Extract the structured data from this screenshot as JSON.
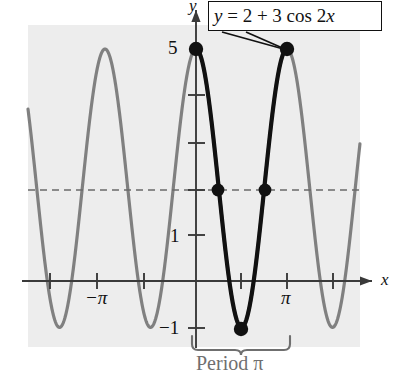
{
  "figure": {
    "name": "trigonometric-cosine-graph",
    "background_color": "#ededed",
    "page_background": "#ffffff",
    "curve_color_secondary": "#808080",
    "curve_color_highlight": "#111111",
    "axis_color": "#3a3a3a",
    "midline_color": "#6a6a6a",
    "annotation_color": "#6f6f6f"
  },
  "callout": {
    "equation_text": "y = 2 + 3 cos 2x",
    "parts": {
      "y": "y",
      "equals": " = 2 + 3 cos 2",
      "x": "x"
    }
  },
  "axes": {
    "y_axis_label": "y",
    "x_axis_label": "x",
    "y_tick_labels": [
      "5",
      "1",
      "−1"
    ],
    "x_tick_labels": [
      "−π",
      "π"
    ]
  },
  "annotations": {
    "period_label": "Period π",
    "period_symbol": "π"
  },
  "chart_data": {
    "type": "line",
    "title": "y = 2 + 3 cos 2x",
    "xlabel": "x",
    "ylabel": "y",
    "function": "y = 2 + 3*cos(2x)",
    "amplitude": 3,
    "vertical_shift": 2,
    "period": "π",
    "midline_y": 2,
    "maximum_y": 5,
    "minimum_y": -1,
    "xlim": [
      -3.55,
      3.55
    ],
    "ylim": [
      -1.6,
      5.6
    ],
    "grid": false,
    "legend": "none",
    "y_ticks": [
      5,
      4,
      3,
      2,
      1,
      0,
      -1
    ],
    "y_tick_labels_shown": [
      {
        "value": 5,
        "label": "5"
      },
      {
        "value": 1,
        "label": "1"
      },
      {
        "value": -1,
        "label": "−1"
      }
    ],
    "x_ticks_radians": [
      -3.1416,
      -2.3562,
      -1.5708,
      -0.7854,
      0,
      0.7854,
      1.5708,
      2.3562,
      3.1416
    ],
    "x_tick_labels_shown": [
      {
        "value": -3.1416,
        "label": "−π"
      },
      {
        "value": 3.1416,
        "label": "π"
      }
    ],
    "highlighted_interval": [
      0,
      3.1416
    ],
    "marked_points": [
      {
        "x": 0,
        "y": 5,
        "note": "maximum at x=0"
      },
      {
        "x": 0.7854,
        "y": 2,
        "note": "midline crossing at x=π/4"
      },
      {
        "x": 1.5708,
        "y": -1,
        "note": "minimum at x=π/2"
      },
      {
        "x": 2.3562,
        "y": 2,
        "note": "midline crossing at x=3π/4"
      },
      {
        "x": 3.1416,
        "y": 5,
        "note": "maximum at x=π"
      }
    ],
    "dashed_line": {
      "y": 2,
      "style": "dashed",
      "note": "midline y = 2"
    },
    "series": [
      {
        "name": "y = 2 + 3 cos 2x",
        "x": [
          -3.55,
          -3.4,
          -3.25,
          -3.1,
          -2.95,
          -2.8,
          -2.65,
          -2.5,
          -2.35,
          -2.2,
          -2.05,
          -1.9,
          -1.75,
          -1.6,
          -1.45,
          -1.3,
          -1.15,
          -1.0,
          -0.85,
          -0.7,
          -0.55,
          -0.4,
          -0.25,
          -0.1,
          0.0,
          0.1,
          0.25,
          0.4,
          0.55,
          0.7,
          0.85,
          1.0,
          1.15,
          1.3,
          1.45,
          1.6,
          1.75,
          1.9,
          2.05,
          2.2,
          2.35,
          2.5,
          2.65,
          2.8,
          2.95,
          3.1,
          3.25,
          3.4,
          3.55
        ],
        "y": [
          4.2,
          4.93,
          4.84,
          4.0,
          2.71,
          1.3,
          0.22,
          -0.27,
          0.05,
          1.0,
          2.27,
          3.5,
          4.38,
          4.87,
          4.79,
          4.04,
          2.77,
          1.13,
          -0.06,
          -0.6,
          -0.42,
          0.7,
          2.28,
          3.75,
          5.0,
          4.91,
          3.46,
          1.61,
          0.16,
          -0.49,
          -0.02,
          1.16,
          2.51,
          3.81,
          4.67,
          4.92,
          4.56,
          3.48,
          2.12,
          0.73,
          -0.14,
          -0.42,
          0.04,
          1.07,
          2.42,
          3.68,
          4.54,
          4.94,
          4.42
        ]
      }
    ]
  }
}
